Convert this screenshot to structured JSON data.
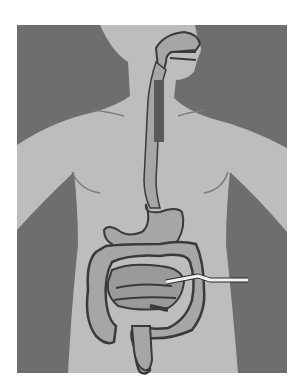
{
  "figure": {
    "style": "grayscale illustration",
    "pointer": {
      "label": ""
    },
    "colors": {
      "page_background": "#ffffff",
      "panel_background": "#6e6e6e",
      "body_silhouette": "#bdbdbd",
      "organ_fill": "#a6a6a6",
      "organ_outline": "#3a3a3a",
      "esophagus_dark": "#5a5a5a",
      "pointer_line": "#f4f4f4"
    }
  }
}
